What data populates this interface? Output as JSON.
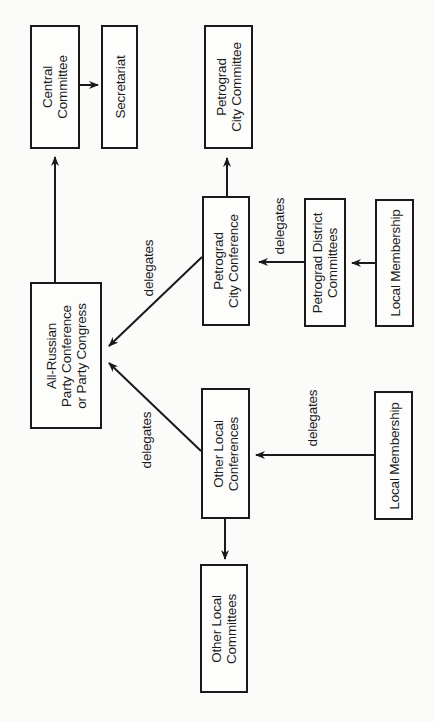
{
  "diagram": {
    "type": "organizational-flow",
    "orientation": "rotated-90-ccw",
    "nodes": {
      "central_committee": "Central\nCommittee",
      "secretariat": "Secretariat",
      "petrograd_city_committee": "Petrograd\nCity Committee",
      "all_russian": "All-Russian\nParty Conference\nor Party Congress",
      "petrograd_city_conference": "Petrograd\nCity Conference",
      "petrograd_district_committees": "Petrograd District\nCommittees",
      "local_membership_petrograd": "Local Membership",
      "other_local_conferences": "Other Local\nConferences",
      "local_membership_other": "Local Membership",
      "other_local_committees": "Other Local\nCommittees"
    },
    "edge_labels": {
      "petrograd_conf_to_all_russian": "delegates",
      "other_conf_to_all_russian": "delegates",
      "district_to_petrograd_conf": "delegates",
      "local_to_other_conf": "delegates"
    },
    "edges": [
      {
        "from": "all_russian",
        "to": "central_committee",
        "label": ""
      },
      {
        "from": "central_committee",
        "to": "secretariat",
        "label": ""
      },
      {
        "from": "petrograd_city_conference",
        "to": "petrograd_city_committee",
        "label": ""
      },
      {
        "from": "petrograd_city_conference",
        "to": "all_russian",
        "label": "delegates"
      },
      {
        "from": "other_local_conferences",
        "to": "all_russian",
        "label": "delegates"
      },
      {
        "from": "petrograd_district_committees",
        "to": "petrograd_city_conference",
        "label": "delegates"
      },
      {
        "from": "local_membership_petrograd",
        "to": "petrograd_district_committees",
        "label": ""
      },
      {
        "from": "local_membership_other",
        "to": "other_local_conferences",
        "label": "delegates"
      },
      {
        "from": "other_local_conferences",
        "to": "other_local_committees",
        "label": ""
      }
    ],
    "colors": {
      "ink": "#1a1a1a",
      "paper": "#fbfbfa"
    }
  }
}
